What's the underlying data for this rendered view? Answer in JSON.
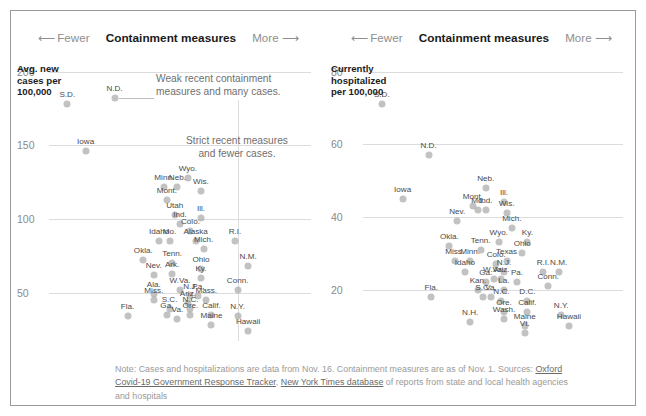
{
  "header": {
    "left_arrow": "⟵",
    "fewer_label": "Fewer",
    "title": "Containment measures",
    "more_label": "More",
    "right_arrow": "⟶"
  },
  "footer": {
    "line1": "Note: Cases and hospitalizations are data from Nov. 16. Containment measures are as of Nov. 1. Sources:",
    "link1": "Oxford Covid-19 Government Response Tracker",
    "separator": ", ",
    "link2": "New York Times database",
    "line2_tail": " of reports from state and local",
    "line3": "health agencies and hospitals"
  },
  "annotations": {
    "weak": "Weak recent containment\nmeasures and many cases.",
    "strict": "Strict recent measures\nand fewer cases."
  },
  "colors": {
    "point": "#aaaaaa",
    "gridline": "#dcdcdc",
    "axis_text": "#8a8a8a",
    "title_text": "#1a1a1a",
    "note_text": "#6f6f6f",
    "frame": "#9a9a9a"
  },
  "chart_data": [
    {
      "type": "scatter",
      "panel": "left",
      "title": "Containment measures",
      "ylabel": "Avg. new\ncases per\n100,000",
      "xlabel": "Containment measures",
      "ylim": [
        20,
        210
      ],
      "yticks": [
        200,
        150,
        100,
        50
      ],
      "xlim": [
        0,
        100
      ],
      "grid": true,
      "reference_line_x": 72,
      "points": [
        {
          "label": "S.D.",
          "x": 7,
          "y": 178
        },
        {
          "label": "N.D.",
          "x": 25,
          "y": 182
        },
        {
          "label": "Iowa",
          "x": 14,
          "y": 146
        },
        {
          "label": "Wyo.",
          "x": 53,
          "y": 128
        },
        {
          "label": "Minn.",
          "x": 44,
          "y": 122
        },
        {
          "label": "Neb.",
          "x": 49,
          "y": 122
        },
        {
          "label": "Wis.",
          "x": 58,
          "y": 119
        },
        {
          "label": "Mont.",
          "x": 45,
          "y": 113
        },
        {
          "label": "Utah",
          "x": 48,
          "y": 103
        },
        {
          "label": "Ill.",
          "x": 58,
          "y": 101
        },
        {
          "label": "Ind.",
          "x": 50,
          "y": 97
        },
        {
          "label": "Colo.",
          "x": 54,
          "y": 92
        },
        {
          "label": "Idaho",
          "x": 42,
          "y": 85
        },
        {
          "label": "Mo.",
          "x": 46,
          "y": 85
        },
        {
          "label": "Alaska",
          "x": 56,
          "y": 85
        },
        {
          "label": "R.I.",
          "x": 71,
          "y": 85
        },
        {
          "label": "Mich.",
          "x": 59,
          "y": 80
        },
        {
          "label": "Okla.",
          "x": 36,
          "y": 72
        },
        {
          "label": "Tenn.",
          "x": 47,
          "y": 70
        },
        {
          "label": "Ohio",
          "x": 58,
          "y": 66
        },
        {
          "label": "N.M.",
          "x": 76,
          "y": 68
        },
        {
          "label": "Nev.",
          "x": 40,
          "y": 62
        },
        {
          "label": "Ark.",
          "x": 47,
          "y": 63
        },
        {
          "label": "Ky.",
          "x": 58,
          "y": 60
        },
        {
          "label": "W.Va.",
          "x": 50,
          "y": 52
        },
        {
          "label": "Conn.",
          "x": 72,
          "y": 52
        },
        {
          "label": "Ala.",
          "x": 40,
          "y": 49
        },
        {
          "label": "N.J.",
          "x": 54,
          "y": 48
        },
        {
          "label": "Pa.",
          "x": 57,
          "y": 48
        },
        {
          "label": "Miss.",
          "x": 40,
          "y": 45
        },
        {
          "label": "Mass.",
          "x": 60,
          "y": 45
        },
        {
          "label": "Ariz.",
          "x": 53,
          "y": 43
        },
        {
          "label": "S.C.",
          "x": 46,
          "y": 39
        },
        {
          "label": "N.C.",
          "x": 54,
          "y": 39
        },
        {
          "label": "Ga.",
          "x": 45,
          "y": 35
        },
        {
          "label": "Ore.",
          "x": 54,
          "y": 35
        },
        {
          "label": "Calif.",
          "x": 62,
          "y": 35
        },
        {
          "label": "Fla.",
          "x": 30,
          "y": 34
        },
        {
          "label": "Va.",
          "x": 49,
          "y": 32
        },
        {
          "label": "N.Y.",
          "x": 72,
          "y": 34
        },
        {
          "label": "Maine",
          "x": 62,
          "y": 28
        },
        {
          "label": "Hawaii",
          "x": 76,
          "y": 24
        }
      ]
    },
    {
      "type": "scatter",
      "panel": "right",
      "title": "Containment measures",
      "ylabel": "Currently\nhospitalized\nper 100,000",
      "xlabel": "Containment measures",
      "ylim": [
        7,
        84
      ],
      "yticks": [
        80,
        60,
        40,
        20
      ],
      "xlim": [
        0,
        100
      ],
      "grid": true,
      "points": [
        {
          "label": "S.D.",
          "x": 8,
          "y": 71
        },
        {
          "label": "N.D.",
          "x": 26,
          "y": 57
        },
        {
          "label": "Neb.",
          "x": 48,
          "y": 48
        },
        {
          "label": "Iowa",
          "x": 16,
          "y": 45
        },
        {
          "label": "Mont.",
          "x": 43,
          "y": 43
        },
        {
          "label": "Md.",
          "x": 45,
          "y": 42
        },
        {
          "label": "Ind.",
          "x": 48,
          "y": 42
        },
        {
          "label": "Ill.",
          "x": 55,
          "y": 44
        },
        {
          "label": "Wis.",
          "x": 56,
          "y": 41
        },
        {
          "label": "Nev.",
          "x": 37,
          "y": 39
        },
        {
          "label": "Mich.",
          "x": 58,
          "y": 37
        },
        {
          "label": "Wyo.",
          "x": 53,
          "y": 33
        },
        {
          "label": "Ky.",
          "x": 64,
          "y": 33
        },
        {
          "label": "Okla.",
          "x": 34,
          "y": 32
        },
        {
          "label": "Tenn.",
          "x": 46,
          "y": 31
        },
        {
          "label": "Ohio",
          "x": 62,
          "y": 30
        },
        {
          "label": "Minn.",
          "x": 42,
          "y": 28
        },
        {
          "label": "Miss.",
          "x": 36,
          "y": 28
        },
        {
          "label": "Colo.",
          "x": 52,
          "y": 27
        },
        {
          "label": "Texas",
          "x": 56,
          "y": 28
        },
        {
          "label": "Idaho",
          "x": 40,
          "y": 25
        },
        {
          "label": "N.J.",
          "x": 55,
          "y": 25
        },
        {
          "label": "R.I.",
          "x": 70,
          "y": 25
        },
        {
          "label": "N.M.",
          "x": 76,
          "y": 25
        },
        {
          "label": "Ariz.",
          "x": 54,
          "y": 23
        },
        {
          "label": "W.Va.",
          "x": 51,
          "y": 23
        },
        {
          "label": "Ga.",
          "x": 48,
          "y": 22
        },
        {
          "label": "Conn.",
          "x": 72,
          "y": 21
        },
        {
          "label": "Pa.",
          "x": 60,
          "y": 22
        },
        {
          "label": "Kan.",
          "x": 45,
          "y": 20
        },
        {
          "label": "La.",
          "x": 55,
          "y": 20
        },
        {
          "label": "S.C.",
          "x": 47,
          "y": 18
        },
        {
          "label": "Va.",
          "x": 50,
          "y": 18
        },
        {
          "label": "Fla.",
          "x": 27,
          "y": 18
        },
        {
          "label": "N.C.",
          "x": 54,
          "y": 17
        },
        {
          "label": "D.C.",
          "x": 64,
          "y": 17
        },
        {
          "label": "Calif.",
          "x": 64,
          "y": 14
        },
        {
          "label": "Ore.",
          "x": 55,
          "y": 14
        },
        {
          "label": "Wash.",
          "x": 55,
          "y": 12
        },
        {
          "label": "N.Y.",
          "x": 77,
          "y": 13
        },
        {
          "label": "N.H.",
          "x": 42,
          "y": 11
        },
        {
          "label": "Maine",
          "x": 63,
          "y": 10
        },
        {
          "label": "Hawaii",
          "x": 80,
          "y": 10
        },
        {
          "label": "Vt.",
          "x": 63,
          "y": 8
        }
      ]
    }
  ]
}
